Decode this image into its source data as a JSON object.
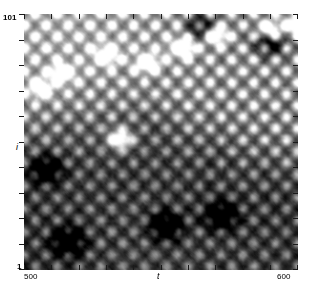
{
  "figure": {
    "kind": "spatiotemporal-grayscale-heatmap",
    "width_px": 313,
    "height_px": 299,
    "background_color": "#ffffff",
    "plot": {
      "left_px": 24,
      "top_px": 14,
      "width_px": 274,
      "height_px": 256,
      "frame_visible": false
    }
  },
  "axes": {
    "y": {
      "label": "i",
      "tick_labels": [
        "101",
        "1"
      ],
      "top_label": "101",
      "bottom_label": "1",
      "min": 1,
      "max": 101,
      "tick_count": 11,
      "label_style": "italic"
    },
    "x": {
      "label": "t",
      "tick_labels": [
        "500",
        "600"
      ],
      "left_label": "500",
      "right_label": "600",
      "min": 500,
      "max": 600,
      "tick_count": 11,
      "label_style": "italic"
    }
  },
  "colormap": {
    "name": "gray",
    "low_color": "#000000",
    "high_color": "#ffffff",
    "reversed": false
  },
  "chart_data": {
    "type": "heatmap",
    "title": "",
    "subtitle": "",
    "xlabel": "t",
    "ylabel": "i",
    "x": [
      500,
      600
    ],
    "y": [
      1,
      101
    ],
    "xlim": [
      500,
      600
    ],
    "ylim": [
      1,
      101
    ],
    "xtick_labels": [
      "500",
      "600"
    ],
    "ytick_labels": [
      "1",
      "101"
    ],
    "grid": false,
    "legend": "none",
    "colorbar": false,
    "colormap": "gray",
    "value_range": [
      0,
      1
    ],
    "annotations": [],
    "structure": {
      "band_upper_mean_level": 0.72,
      "band_lower_mean_level": 0.28,
      "interface_points": [
        {
          "t": 500,
          "i": 58
        },
        {
          "t": 520,
          "i": 62
        },
        {
          "t": 545,
          "i": 64
        },
        {
          "t": 565,
          "i": 55
        },
        {
          "t": 585,
          "i": 47
        },
        {
          "t": 600,
          "i": 42
        }
      ],
      "wave_family_1": {
        "wavelength_sites": 9.0,
        "period_time": 8.0,
        "direction": "right-down",
        "amplitude": 0.17
      },
      "wave_family_2": {
        "wavelength_sites": 9.0,
        "period_time": 8.0,
        "direction": "right-up",
        "amplitude": 0.17
      },
      "bright_spots": [
        {
          "t": 558,
          "i": 88,
          "intensity": 1.0
        },
        {
          "t": 570,
          "i": 93,
          "intensity": 0.95
        },
        {
          "t": 590,
          "i": 95,
          "intensity": 0.92
        },
        {
          "t": 600,
          "i": 97,
          "intensity": 0.9
        },
        {
          "t": 535,
          "i": 52,
          "intensity": 0.98
        },
        {
          "t": 545,
          "i": 82,
          "intensity": 0.88
        },
        {
          "t": 530,
          "i": 85,
          "intensity": 0.85
        },
        {
          "t": 514,
          "i": 78,
          "intensity": 0.82
        },
        {
          "t": 506,
          "i": 72,
          "intensity": 0.8
        }
      ],
      "dark_spots": [
        {
          "t": 516,
          "i": 12,
          "intensity": 0.02
        },
        {
          "t": 572,
          "i": 22,
          "intensity": 0.02
        },
        {
          "t": 552,
          "i": 18,
          "intensity": 0.05
        },
        {
          "t": 508,
          "i": 40,
          "intensity": 0.06
        },
        {
          "t": 565,
          "i": 96,
          "intensity": 0.1
        },
        {
          "t": 590,
          "i": 90,
          "intensity": 0.12
        }
      ]
    }
  }
}
